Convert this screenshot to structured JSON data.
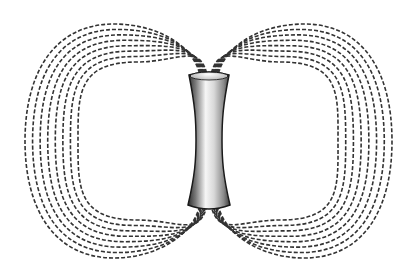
{
  "diagram": {
    "field_lines_per_side": 8,
    "line_color": "#333333",
    "magnet_colors": {
      "light": "#f4f4f4",
      "mid": "#b5b5b5",
      "dark": "#3a3a3a",
      "outline": "#1a1a1a"
    },
    "magnet": {
      "top_y": 75,
      "bottom_y": 205,
      "top_half_width": 20,
      "waist_half_width": 13,
      "center_x": 209
    },
    "left_lobe": {
      "outer_x": 25,
      "inner_x": 78,
      "outer_top": 24,
      "outer_bottom": 258,
      "inner_top": 62,
      "inner_bottom": 220
    },
    "right_lobe": {
      "outer_x": 392,
      "inner_x": 338,
      "outer_top": 24,
      "outer_bottom": 258,
      "inner_top": 62,
      "inner_bottom": 220
    }
  }
}
